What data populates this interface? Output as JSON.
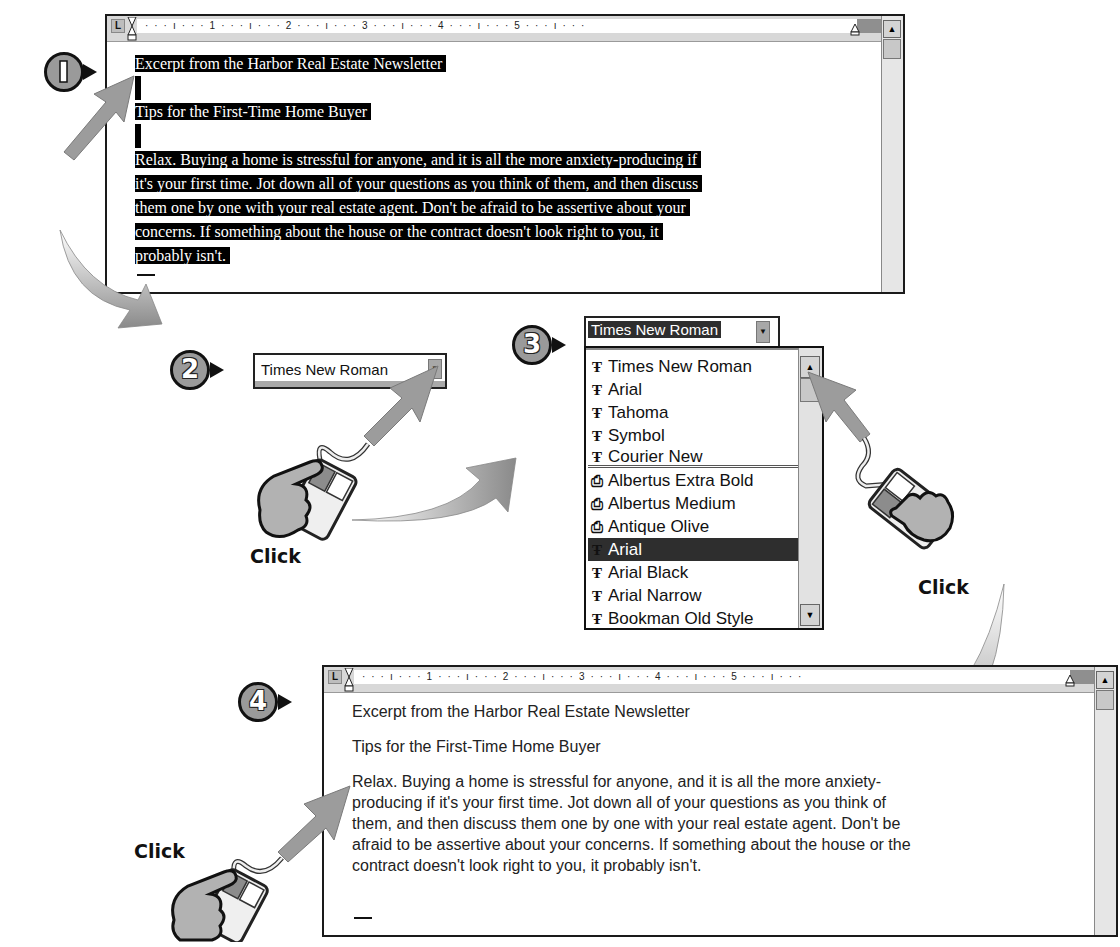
{
  "steps": [
    {
      "number": "1",
      "description": "Select text"
    },
    {
      "number": "2",
      "description": "Click font dropdown arrow"
    },
    {
      "number": "3",
      "description": "Click font in list"
    },
    {
      "number": "4",
      "description": "Click to deselect"
    }
  ],
  "ruler": {
    "tab_stop": "L",
    "marks_top": "· · · ı · · · 1 · · · ı · · · 2 · · · ı · · · 3 · · · ı · · · 4 · · · ı · · · 5 · · · ı · · ·",
    "marks_bottom": "· · · ı · · · 1 · · · ı · · · 2 · · · ı · · · 3 · · · ı · · · 4 · · · ı · · · 5 · · · ı · · ·"
  },
  "document_before": {
    "font": "Times New Roman",
    "selected": true,
    "lines": [
      "Excerpt from the Harbor Real Estate Newsletter",
      "",
      "Tips for the First-Time Home Buyer",
      "",
      "Relax. Buying a home is stressful for anyone, and it is all the more anxiety-producing if",
      "it's your first time. Jot down all of your questions as you think of them, and then discuss",
      "them one by one with your real estate agent. Don't be afraid to be assertive about your",
      "concerns. If something about the house or the contract doesn't look right to you, it",
      "probably isn't."
    ]
  },
  "font_combo_step2": {
    "value": "Times New Roman",
    "arrow": "▼"
  },
  "font_combo_step3": {
    "value": "Times New Roman",
    "arrow": "▼"
  },
  "font_list": {
    "recent_fonts": [
      {
        "icon": "truetype-icon",
        "glyph": "Ŧ",
        "label": "Times New Roman"
      },
      {
        "icon": "truetype-icon",
        "glyph": "Ŧ",
        "label": "Arial"
      },
      {
        "icon": "truetype-icon",
        "glyph": "Ŧ",
        "label": "Tahoma"
      },
      {
        "icon": "truetype-icon",
        "glyph": "Ŧ",
        "label": "Symbol"
      },
      {
        "icon": "truetype-icon",
        "glyph": "Ŧ",
        "label": "Courier New"
      }
    ],
    "all_fonts": [
      {
        "icon": "printer-font-icon",
        "glyph": "⎙",
        "label": "Albertus Extra Bold",
        "selected": false
      },
      {
        "icon": "printer-font-icon",
        "glyph": "⎙",
        "label": "Albertus Medium",
        "selected": false
      },
      {
        "icon": "printer-font-icon",
        "glyph": "⎙",
        "label": "Antique Olive",
        "selected": false
      },
      {
        "icon": "truetype-icon",
        "glyph": "Ŧ",
        "label": "Arial",
        "selected": true
      },
      {
        "icon": "truetype-icon",
        "glyph": "Ŧ",
        "label": "Arial Black",
        "selected": false
      },
      {
        "icon": "truetype-icon",
        "glyph": "Ŧ",
        "label": "Arial Narrow",
        "selected": false
      },
      {
        "icon": "truetype-icon",
        "glyph": "Ŧ",
        "label": "Bookman Old Style",
        "selected": false
      }
    ],
    "scroll_up": "▲",
    "scroll_down": "▼"
  },
  "document_after": {
    "font": "Arial",
    "selected": false,
    "lines": [
      "Excerpt from the Harbor Real Estate Newsletter",
      "",
      "Tips for the First-Time Home Buyer",
      "",
      "Relax. Buying a home is stressful for anyone, and it is all the more anxiety-",
      "producing if it's your first time. Jot down all of your questions as you think of",
      "them, and then discuss them one by one with your real estate agent. Don't be",
      "afraid to be assertive about your concerns. If something about the house or the",
      "contract doesn't look right to you, it probably isn't."
    ]
  },
  "click_labels": [
    "Click",
    "Click",
    "Click"
  ],
  "scrollbar": {
    "up": "▲"
  },
  "colors": {
    "selection": "#000000",
    "badge_fill": "#9a9a9a",
    "arrow_fill": "#9c9c9c",
    "list_highlight": "#2e2e2e"
  }
}
